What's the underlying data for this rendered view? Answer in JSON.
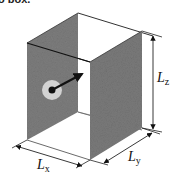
{
  "caption": "o box.",
  "diagram": {
    "labels": {
      "lx": {
        "main": "L",
        "sub": "x"
      },
      "ly": {
        "main": "L",
        "sub": "y"
      },
      "lz": {
        "main": "L",
        "sub": "z"
      }
    },
    "colors": {
      "wall": "#7a7a7a",
      "edge": "#222222",
      "particle_halo": "#cfcfcf",
      "particle": "#111111",
      "background": "#ffffff"
    }
  }
}
